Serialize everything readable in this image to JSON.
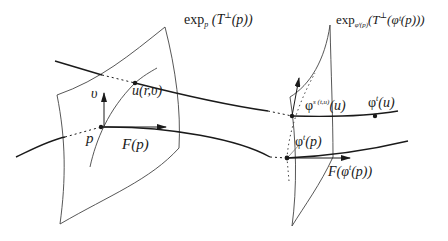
{
  "diagram": {
    "type": "geometric-flow-illustration",
    "labels": {
      "left_surface": {
        "base": "exp",
        "subscript": "p",
        "body": " (T",
        "sup": "⊥",
        "tail": "(p))"
      },
      "right_surface": {
        "base": "exp",
        "subscript": "φᵗ(p)",
        "body": "(T",
        "sup": "⊥",
        "tail": "(φᵗ(p)))"
      },
      "vector_v": "υ",
      "point_u": "u(r,υ)",
      "point_p": "p",
      "vector_F_p": "F(p)",
      "point_phi_s_u": {
        "base": "φ",
        "sup": "s (t,u)",
        "tail": "(u)"
      },
      "point_phi_t_u": {
        "base": "φ",
        "sup": "t",
        "tail": "(u)"
      },
      "point_phi_t_p": {
        "base": "φ",
        "sup": "t",
        "tail": "(p)"
      },
      "vector_F_phi_t_p": {
        "head": "F(φ",
        "sup": "t",
        "tail": "(p))"
      }
    },
    "colors": {
      "stroke": "#1a1a1a",
      "thin": "#444444",
      "background": "#ffffff"
    }
  }
}
